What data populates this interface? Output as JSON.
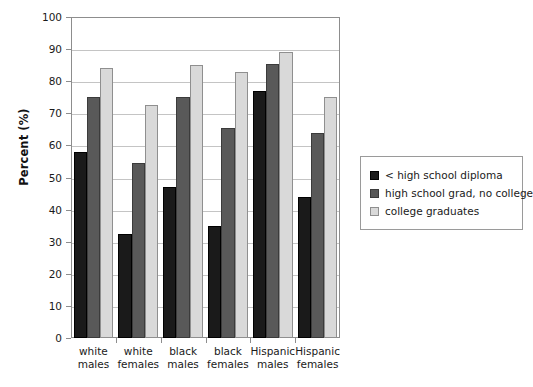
{
  "chart_data": {
    "type": "bar",
    "title": "",
    "xlabel": "",
    "ylabel": "Percent (%)",
    "ylim": [
      0,
      100
    ],
    "ytick_labels": [
      "100",
      "90",
      "80",
      "70",
      "60",
      "50",
      "40",
      "30",
      "20",
      "10",
      "0"
    ],
    "yticks": [
      100,
      90,
      80,
      70,
      60,
      50,
      40,
      30,
      20,
      10,
      0
    ],
    "grid": true,
    "legend_position": "right",
    "categories": [
      "white males",
      "white females",
      "black males",
      "black females",
      "Hispanic males",
      "Hispanic females"
    ],
    "category_lines": [
      [
        "white",
        "males"
      ],
      [
        "white",
        "females"
      ],
      [
        "black",
        "males"
      ],
      [
        "black",
        "females"
      ],
      [
        "Hispanic",
        "males"
      ],
      [
        "Hispanic",
        "females"
      ]
    ],
    "series": [
      {
        "name": "< high school diploma",
        "color": "#1a1a1a",
        "values": [
          58,
          32.5,
          47,
          35,
          77,
          44
        ]
      },
      {
        "name": "high school grad, no college",
        "color": "#595959",
        "values": [
          75,
          54.5,
          75,
          65.5,
          85.5,
          64
        ]
      },
      {
        "name": "college graduates",
        "color": "#d9d9d9",
        "values": [
          84,
          72.5,
          85,
          83,
          89,
          75
        ]
      }
    ]
  },
  "legend": {
    "items": [
      {
        "label": "< high school diploma",
        "swatch": "black-swatch"
      },
      {
        "label": "high school grad, no college",
        "swatch": "dark-gray-swatch"
      },
      {
        "label": "college graduates",
        "swatch": "light-gray-swatch"
      }
    ]
  }
}
